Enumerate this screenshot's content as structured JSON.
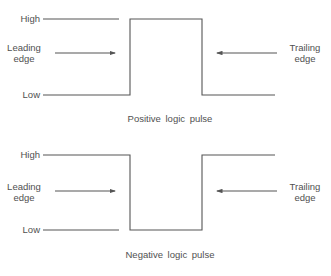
{
  "diagrams": [
    {
      "caption": "Positive logic pulse",
      "high_label": "High",
      "low_label": "Low",
      "leading_edge_label": [
        "Leading",
        "edge"
      ],
      "trailing_edge_label": [
        "Trailing",
        "edge"
      ]
    },
    {
      "caption": "Negative logic pulse",
      "high_label": "High",
      "low_label": "Low",
      "leading_edge_label": [
        "Leading",
        "edge"
      ],
      "trailing_edge_label": [
        "Trailing",
        "edge"
      ]
    }
  ],
  "colors": {
    "line": "#555555",
    "text": "#505050"
  }
}
